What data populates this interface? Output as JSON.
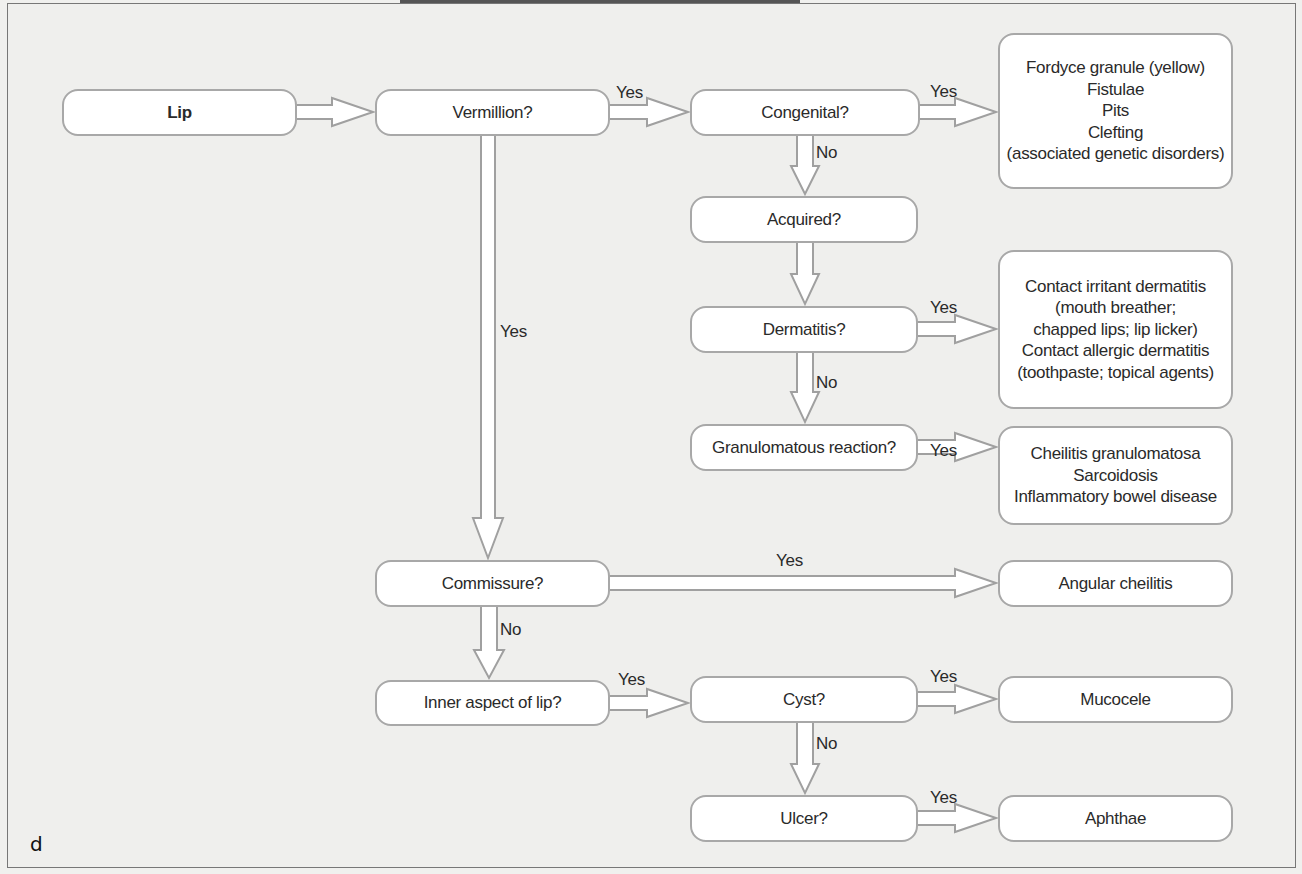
{
  "diagram": {
    "panel_letter": "d",
    "nodes": {
      "lip": "Lip",
      "vermillion": "Vermillion?",
      "congenital": "Congenital?",
      "acquired": "Acquired?",
      "dermatitis": "Dermatitis?",
      "granulomatous": "Granulomatous reaction?",
      "commissure": "Commissure?",
      "inner_aspect": "Inner aspect of lip?",
      "cyst": "Cyst?",
      "ulcer": "Ulcer?"
    },
    "outcomes": {
      "congenital": [
        "Fordyce granule (yellow)",
        "Fistulae",
        "Pits",
        "Clefting",
        "(associated genetic disorders)"
      ],
      "dermatitis": [
        "Contact irritant dermatitis",
        "(mouth breather;",
        "chapped lips; lip licker)",
        "Contact allergic dermatitis",
        "(toothpaste; topical agents)"
      ],
      "granulomatous": [
        "Cheilitis granulomatosa",
        "Sarcoidosis",
        "Inflammatory bowel disease"
      ],
      "commissure": [
        "Angular cheilitis"
      ],
      "cyst": [
        "Mucocele"
      ],
      "ulcer": [
        "Aphthae"
      ]
    },
    "edge_labels": {
      "vermillion_yes": "Yes",
      "vermillion_down_yes": "Yes",
      "congenital_yes": "Yes",
      "congenital_no": "No",
      "dermatitis_yes": "Yes",
      "dermatitis_no": "No",
      "granulomatous_yes": "Yes",
      "commissure_yes": "Yes",
      "commissure_no": "No",
      "inner_yes": "Yes",
      "cyst_yes": "Yes",
      "cyst_no": "No",
      "ulcer_yes": "Yes"
    },
    "colors": {
      "background": "#efefed",
      "node_fill": "#ffffff",
      "node_border": "#a8a8a8",
      "arrow_stroke": "#a0a0a0",
      "text": "#2a2a2a"
    }
  }
}
